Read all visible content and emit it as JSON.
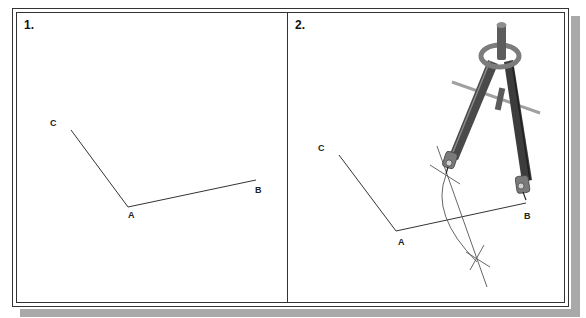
{
  "figure": {
    "panels": [
      {
        "label": "1.",
        "points": {
          "C": "C",
          "A": "A",
          "B": "B"
        },
        "description": "Angle BAC drawn with two line segments"
      },
      {
        "label": "2.",
        "points": {
          "C": "C",
          "A": "A",
          "B": "B"
        },
        "description": "Compass used to construct perpendicular bisector of segment AB"
      }
    ],
    "colors": {
      "line": "#333333",
      "frame": "#333333",
      "shadow": "#a9a9a9",
      "compass_dark": "#4a4a4a",
      "compass_light": "#9a9a9a"
    }
  }
}
